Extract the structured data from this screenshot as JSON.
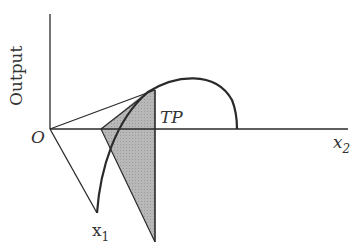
{
  "diagram": {
    "labels": {
      "y_axis": "Output",
      "origin": "O",
      "tp": "TP",
      "x1": "x",
      "x1_sub": "1",
      "x2": "x",
      "x2_sub": "2"
    },
    "colors": {
      "line": "#2a2a2a",
      "shade": "#b3b3b3",
      "text": "#333333",
      "background": "#ffffff"
    }
  }
}
